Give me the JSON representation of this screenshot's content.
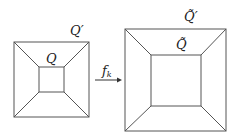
{
  "diagram": {
    "left": {
      "outer_label": "Q′",
      "inner_label": "Q",
      "outer": [
        14,
        42,
        89,
        117
      ],
      "inner": [
        39,
        67,
        64,
        92
      ]
    },
    "right": {
      "outer_label": "Q̃′",
      "inner_label": "Q̃",
      "outer": [
        125,
        29,
        226,
        131
      ],
      "inner": [
        151,
        55,
        201,
        106
      ]
    },
    "arrow": {
      "label": "f",
      "subscript": "k"
    },
    "colors": {
      "line": "#555555",
      "text": "#222222"
    }
  }
}
